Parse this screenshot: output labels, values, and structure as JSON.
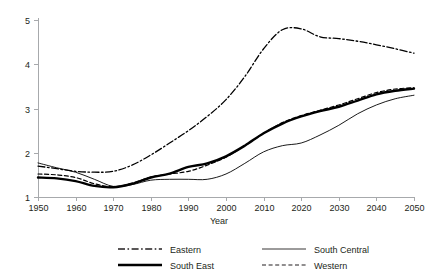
{
  "chart_data": {
    "type": "line",
    "title": "",
    "xlabel": "Year",
    "ylabel": "",
    "xlim": [
      1950,
      2050
    ],
    "ylim": [
      1,
      5
    ],
    "grid": false,
    "legend_position": "bottom",
    "xticks": [
      1950,
      1960,
      1970,
      1980,
      1990,
      2000,
      2010,
      2020,
      2030,
      2040,
      2050
    ],
    "xtick_labels": [
      "1950",
      "1960",
      "1970",
      "1980",
      "1990",
      "2000",
      "2010",
      "2020",
      "2030",
      "2040",
      "2050"
    ],
    "yticks": [
      1,
      2,
      3,
      4,
      5
    ],
    "ytick_labels": [
      "1",
      "2",
      "3",
      "4",
      "5"
    ],
    "x": [
      1950,
      1955,
      1960,
      1965,
      1970,
      1975,
      1980,
      1985,
      1990,
      1995,
      2000,
      2005,
      2010,
      2015,
      2020,
      2025,
      2030,
      2035,
      2040,
      2045,
      2050
    ],
    "series": [
      {
        "name": "Eastern",
        "style": "dashdot",
        "width": 1.3,
        "color": "#231f20",
        "values": [
          1.7,
          1.64,
          1.58,
          1.56,
          1.58,
          1.72,
          1.95,
          2.22,
          2.5,
          2.82,
          3.2,
          3.72,
          4.35,
          4.78,
          4.8,
          4.62,
          4.58,
          4.52,
          4.44,
          4.35,
          4.25
        ]
      },
      {
        "name": "South East",
        "style": "solid",
        "width": 2.4,
        "color": "#000000",
        "values": [
          1.44,
          1.42,
          1.36,
          1.25,
          1.22,
          1.3,
          1.44,
          1.53,
          1.68,
          1.76,
          1.92,
          2.16,
          2.44,
          2.66,
          2.82,
          2.94,
          3.04,
          3.18,
          3.32,
          3.4,
          3.45
        ]
      },
      {
        "name": "South Central",
        "style": "thin-solid",
        "width": 0.9,
        "color": "#231f20",
        "values": [
          1.77,
          1.66,
          1.56,
          1.4,
          1.24,
          1.28,
          1.38,
          1.4,
          1.4,
          1.4,
          1.52,
          1.76,
          2.02,
          2.16,
          2.22,
          2.4,
          2.62,
          2.88,
          3.08,
          3.22,
          3.3
        ]
      },
      {
        "name": "Western",
        "style": "dashed",
        "width": 1.2,
        "color": "#231f20",
        "values": [
          1.52,
          1.5,
          1.44,
          1.3,
          1.23,
          1.31,
          1.45,
          1.52,
          1.58,
          1.72,
          1.9,
          2.16,
          2.44,
          2.68,
          2.84,
          2.96,
          3.08,
          3.22,
          3.36,
          3.44,
          3.47
        ]
      }
    ]
  },
  "legend": {
    "entries": [
      {
        "label": "Eastern",
        "key": "Eastern"
      },
      {
        "label": "South Central",
        "key": "South Central"
      },
      {
        "label": "South East",
        "key": "South East"
      },
      {
        "label": "Western",
        "key": "Western"
      }
    ]
  }
}
